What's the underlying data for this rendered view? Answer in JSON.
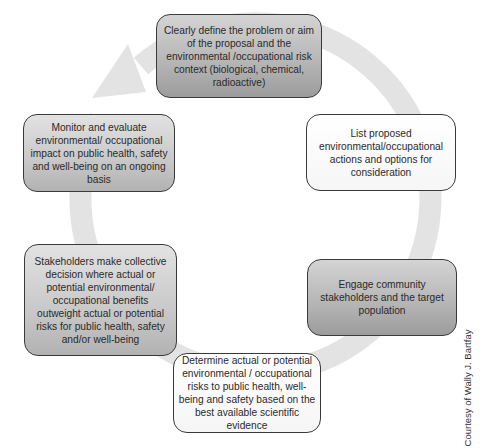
{
  "diagram": {
    "type": "cycle",
    "ring_color": "#e3e3e3",
    "steps": [
      {
        "id": 1,
        "text": "Clearly define the problem or aim of the proposal and the environmental /occupational risk context (biological, chemical, radioactive)",
        "shade": "dark"
      },
      {
        "id": 2,
        "text": "List proposed environmental/occupational actions and options for consideration",
        "shade": "light"
      },
      {
        "id": 3,
        "text": "Engage community stakeholders and the target population",
        "shade": "dark"
      },
      {
        "id": 4,
        "text": "Determine actual or potential environmental / occupational risks to public health, well-being and safety based on the best available scientific evidence",
        "shade": "light"
      },
      {
        "id": 5,
        "text": "Stakeholders make collective decision where actual or potential environmental/ occupational benefits outweight actual or potential risks for public health, safety and/or well-being",
        "shade": "mid"
      },
      {
        "id": 6,
        "text": "Monitor and evaluate environmental/ occupational impact on public health, safety and well-being on an ongoing basis",
        "shade": "mid"
      }
    ],
    "credit": "Courtesy of Wally J. Bartfay"
  }
}
